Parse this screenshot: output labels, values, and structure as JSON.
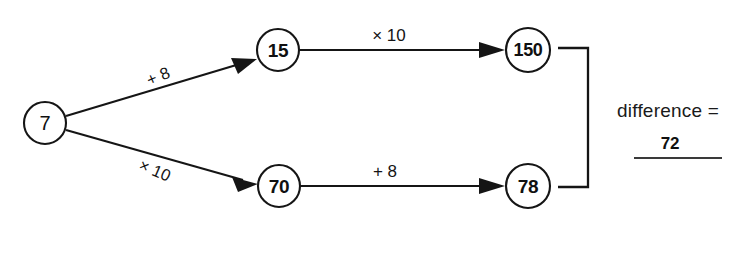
{
  "diagram": {
    "type": "flow-arrow-diagram",
    "background_color": "#ffffff",
    "ink_color": "#151515",
    "nodes": [
      {
        "id": "start",
        "label": "7",
        "cx": 45,
        "cy": 123,
        "r": 21
      },
      {
        "id": "top-mid",
        "label": "15",
        "cx": 278,
        "cy": 50,
        "r": 21
      },
      {
        "id": "top-end",
        "label": "150",
        "cx": 528,
        "cy": 50,
        "r": 22
      },
      {
        "id": "bottom-mid",
        "label": "70",
        "cx": 279,
        "cy": 186,
        "r": 21
      },
      {
        "id": "bottom-end",
        "label": "78",
        "cx": 528,
        "cy": 186,
        "r": 22
      }
    ],
    "edges": [
      {
        "id": "start-to-top",
        "label": "+ 8",
        "label_x": 158,
        "label_y": 76,
        "rotation": -23,
        "orientation": "slanted-up"
      },
      {
        "id": "start-to-bottom",
        "label": "× 10",
        "label_x": 155,
        "label_y": 170,
        "rotation": 23,
        "orientation": "slanted-down"
      },
      {
        "id": "top-mid-to-top-end",
        "label": "× 10",
        "label_x": 389,
        "label_y": 35,
        "rotation": 0,
        "orientation": "horizontal"
      },
      {
        "id": "bottom-mid-to-bottom-end",
        "label": "+ 8",
        "label_x": 385,
        "label_y": 171,
        "rotation": 0,
        "orientation": "horizontal"
      }
    ],
    "bracket": {
      "id": "difference-bracket",
      "top_y": 48,
      "bottom_y": 187,
      "left_x": 558,
      "right_x": 588
    },
    "result": {
      "prompt": "difference =",
      "prompt_x": 668,
      "prompt_y": 110,
      "answer": "72",
      "answer_x": 670,
      "answer_y": 143,
      "rule_x1": 634,
      "rule_x2": 722,
      "rule_y": 158
    }
  }
}
